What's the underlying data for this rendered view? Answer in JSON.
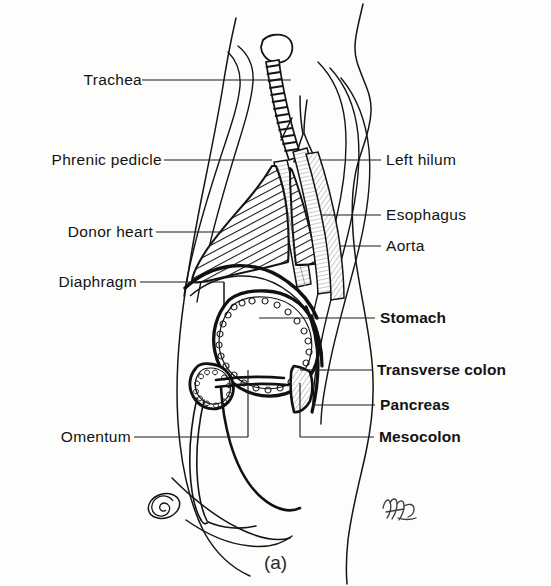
{
  "figure": {
    "caption": "(a)",
    "type": "sagittal-anatomical-illustration",
    "ink_color": "#111111",
    "background_color": "#fdfdfc"
  },
  "labels_left": [
    {
      "id": "trachea",
      "text": "Trachea",
      "x": 68,
      "y": 72,
      "weight": "regular",
      "leader": {
        "x1": 142,
        "y1": 80,
        "x2": 291,
        "y2": 80
      }
    },
    {
      "id": "phrenic-pedicle",
      "text": "Phrenic pedicle",
      "x": 18,
      "y": 152,
      "weight": "regular",
      "leader": {
        "x1": 164,
        "y1": 160,
        "x2": 272,
        "y2": 160
      }
    },
    {
      "id": "donor-heart",
      "text": "Donor heart",
      "x": 39,
      "y": 224,
      "weight": "regular",
      "leader": {
        "x1": 156,
        "y1": 232,
        "x2": 222,
        "y2": 232
      }
    },
    {
      "id": "diaphragm",
      "text": "Diaphragm",
      "x": 41,
      "y": 274,
      "weight": "regular",
      "leader": {
        "x1": 140,
        "y1": 282,
        "x2": 224,
        "y2": 282
      }
    },
    {
      "id": "omentum",
      "text": "Omentum",
      "x": 51,
      "y": 429,
      "weight": "regular",
      "leader": {
        "x1": 134,
        "y1": 437,
        "x2": 248,
        "y2": 437
      }
    }
  ],
  "labels_right": [
    {
      "id": "left-hilum",
      "text": "Left hilum",
      "x": 386,
      "y": 152,
      "weight": "regular",
      "leader": {
        "x1": 337,
        "y1": 160,
        "x2": 381,
        "y2": 160
      }
    },
    {
      "id": "esophagus",
      "text": "Esophagus",
      "x": 386,
      "y": 207,
      "weight": "regular",
      "leader": {
        "x1": 324,
        "y1": 215,
        "x2": 381,
        "y2": 215
      }
    },
    {
      "id": "aorta",
      "text": "Aorta",
      "x": 386,
      "y": 238,
      "weight": "regular",
      "leader": {
        "x1": 340,
        "y1": 246,
        "x2": 381,
        "y2": 246
      }
    },
    {
      "id": "stomach",
      "text": "Stomach",
      "x": 380,
      "y": 310,
      "weight": "semi",
      "leader": {
        "x1": 259,
        "y1": 318,
        "x2": 375,
        "y2": 318
      }
    },
    {
      "id": "transverse-colon",
      "text": "Transverse colon",
      "x": 377,
      "y": 362,
      "weight": "semi",
      "leader": {
        "x1": 326,
        "y1": 370,
        "x2": 372,
        "y2": 370
      }
    },
    {
      "id": "pancreas",
      "text": "Pancreas",
      "x": 380,
      "y": 397,
      "weight": "semi",
      "leader": {
        "x1": 312,
        "y1": 405,
        "x2": 375,
        "y2": 405
      }
    },
    {
      "id": "mesocolon",
      "text": "Mesocolon",
      "x": 379,
      "y": 429,
      "weight": "bold",
      "leader": {
        "x1": 355,
        "y1": 437,
        "x2": 374,
        "y2": 437
      }
    }
  ],
  "structures": [
    {
      "id": "body-outline",
      "name": "Body outline",
      "fill": "none",
      "stroke": "#111111"
    },
    {
      "id": "trachea-shape",
      "name": "Trachea",
      "fill": "#ffffff",
      "stroke": "#111111",
      "detail": "cartilage rings"
    },
    {
      "id": "donor-heart-shape",
      "name": "Donor heart",
      "fill": "hatch",
      "stroke": "#111111",
      "detail": "diagonal hatching"
    },
    {
      "id": "diaphragm-shape",
      "name": "Diaphragm",
      "fill": "none",
      "stroke": "#111111",
      "detail": "thick dome curve"
    },
    {
      "id": "stomach-shape",
      "name": "Stomach",
      "fill": "#ffffff",
      "stroke": "#111111",
      "detail": "scalloped rugae outline"
    },
    {
      "id": "esophagus-shape",
      "name": "Esophagus",
      "fill": "#e9e9e9",
      "stroke": "#111111"
    },
    {
      "id": "aorta-shape",
      "name": "Aorta",
      "fill": "#ededed",
      "stroke": "#111111"
    },
    {
      "id": "hilum-shape",
      "name": "Left hilum",
      "fill": "#ffffff",
      "stroke": "#111111",
      "detail": "vessel cluster circles"
    },
    {
      "id": "colon-shape",
      "name": "Transverse colon",
      "fill": "#ffffff",
      "stroke": "#111111"
    },
    {
      "id": "pancreas-shape",
      "name": "Pancreas",
      "fill": "#e4e4e4",
      "stroke": "#111111",
      "detail": "wedge"
    },
    {
      "id": "mesocolon-shape",
      "name": "Mesocolon",
      "fill": "none",
      "stroke": "#111111"
    },
    {
      "id": "omentum-shape",
      "name": "Omentum",
      "fill": "none",
      "stroke": "#111111",
      "detail": "apron drape"
    },
    {
      "id": "umbilicus-shape",
      "name": "Umbilicus",
      "fill": "none",
      "stroke": "#111111",
      "detail": "spiral"
    },
    {
      "id": "artist-signature",
      "name": "Artist signature",
      "fill": "none",
      "stroke": "#3a3a3a"
    }
  ]
}
